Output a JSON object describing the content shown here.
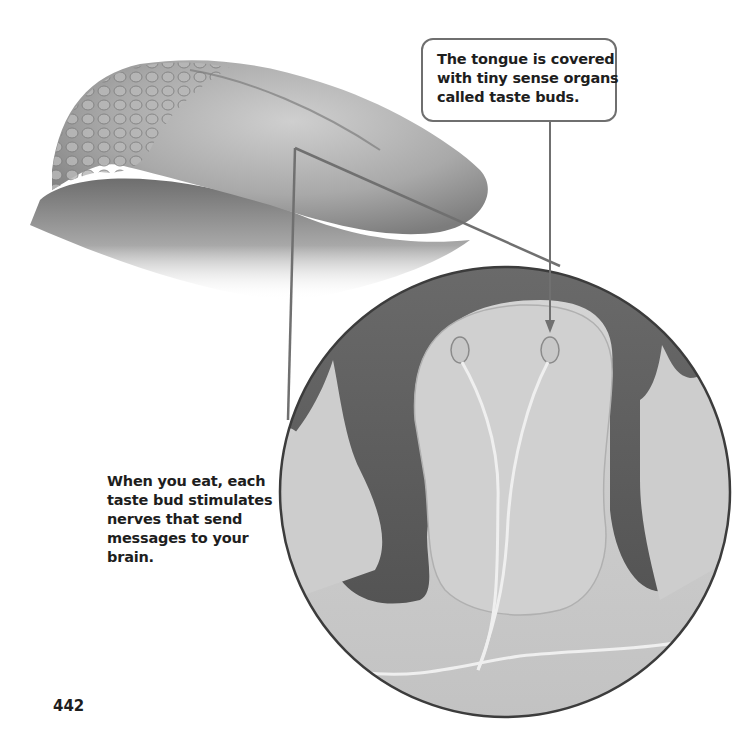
{
  "figure": {
    "colors": {
      "background": "#ffffff",
      "tongue_light": "#c4c4c4",
      "tongue_dark": "#7a7a7a",
      "circle_background": "#5c5c5c",
      "papilla_fill": "#c9c9c9",
      "leader_line": "#707070",
      "circle_border": "#3c3c3c"
    },
    "magnifier_circle": {
      "cx": 505,
      "cy": 492,
      "r": 225
    }
  },
  "callout_top": {
    "lines": [
      "The tongue is covered",
      "with tiny sense organs",
      "called taste buds."
    ]
  },
  "caption_left": {
    "lines": [
      "When you eat, each",
      "taste bud stimulates",
      "nerves that send",
      "messages to your",
      "brain."
    ]
  },
  "page": {
    "number": "442"
  }
}
